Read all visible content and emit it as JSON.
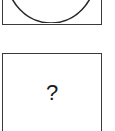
{
  "tiles": [
    {
      "id": "shape-circle",
      "icon": "circle-icon",
      "label": ""
    },
    {
      "id": "shape-unknown",
      "icon": "question-mark-icon",
      "label": "?"
    }
  ],
  "colors": {
    "border": "#3a3a3a",
    "glyph": "#1a1a1a",
    "background": "#ffffff"
  }
}
